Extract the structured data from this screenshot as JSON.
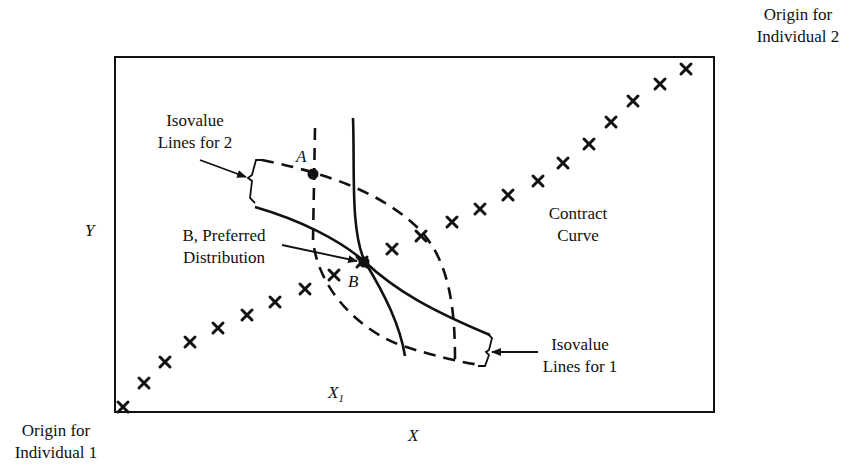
{
  "diagram": {
    "type": "edgeworth-box",
    "labels": {
      "origin_2_line1": "Origin for",
      "origin_2_line2": "Individual 2",
      "origin_1_line1": "Origin for",
      "origin_1_line2": "Individual 1",
      "isovalue_2_line1": "Isovalue",
      "isovalue_2_line2": "Lines for 2",
      "isovalue_1_line1": "Isovalue",
      "isovalue_1_line2": "Lines for 1",
      "preferred_line1": "B, Preferred",
      "preferred_line2": "Distribution",
      "contract_line1": "Contract",
      "contract_line2": "Curve",
      "point_a": "A",
      "point_b": "B",
      "axis_y": "Y",
      "axis_x": "X",
      "x1_main": "X",
      "x1_sub": "1"
    },
    "colors": {
      "ink": "#111111",
      "background": "#ffffff"
    }
  }
}
